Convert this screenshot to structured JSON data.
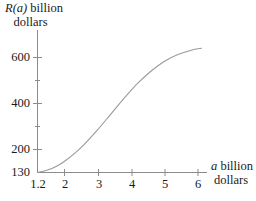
{
  "figure": {
    "background_color": "#ffffff",
    "ink_color": "#1a1a1a",
    "curve_color": "#9a9a9a",
    "axis_color": "#8c8c8c",
    "width": 256,
    "height": 201
  },
  "y_axis": {
    "title_line1_var": "R(a)",
    "title_line1_rest": " billion",
    "title_line2": "dollars",
    "tick_labels": [
      "600",
      "400",
      "200",
      "130"
    ]
  },
  "x_axis": {
    "title_line1_var": "a",
    "title_line1_rest": " billion",
    "title_line2": "dollars",
    "tick_labels": [
      "1.2",
      "2",
      "3",
      "4",
      "5",
      "6"
    ]
  },
  "chart_data": {
    "type": "line",
    "title": "",
    "xlabel": "a billion dollars",
    "ylabel": "R(a) billion dollars",
    "xlim": [
      1.2,
      6.3
    ],
    "ylim": [
      130,
      680
    ],
    "grid": false,
    "legend": "none",
    "x_ticks": [
      1.2,
      2,
      3,
      4,
      5,
      6
    ],
    "x_tick_labels": [
      "1.2",
      "2",
      "3",
      "4",
      "5",
      "6"
    ],
    "y_ticks": [
      130,
      200,
      400,
      600
    ],
    "y_tick_labels": [
      "130",
      "200",
      "400",
      "600"
    ],
    "y_minor_ticks": [
      300,
      500
    ],
    "series": [
      {
        "name": "R(a)",
        "x": [
          1.2,
          1.5,
          1.8,
          2.0,
          2.3,
          2.6,
          3.0,
          3.4,
          3.8,
          4.2,
          4.6,
          5.0,
          5.4,
          5.8,
          6.1
        ],
        "y": [
          130,
          140,
          158,
          175,
          207,
          245,
          305,
          370,
          435,
          495,
          545,
          585,
          612,
          630,
          638
        ]
      }
    ]
  }
}
